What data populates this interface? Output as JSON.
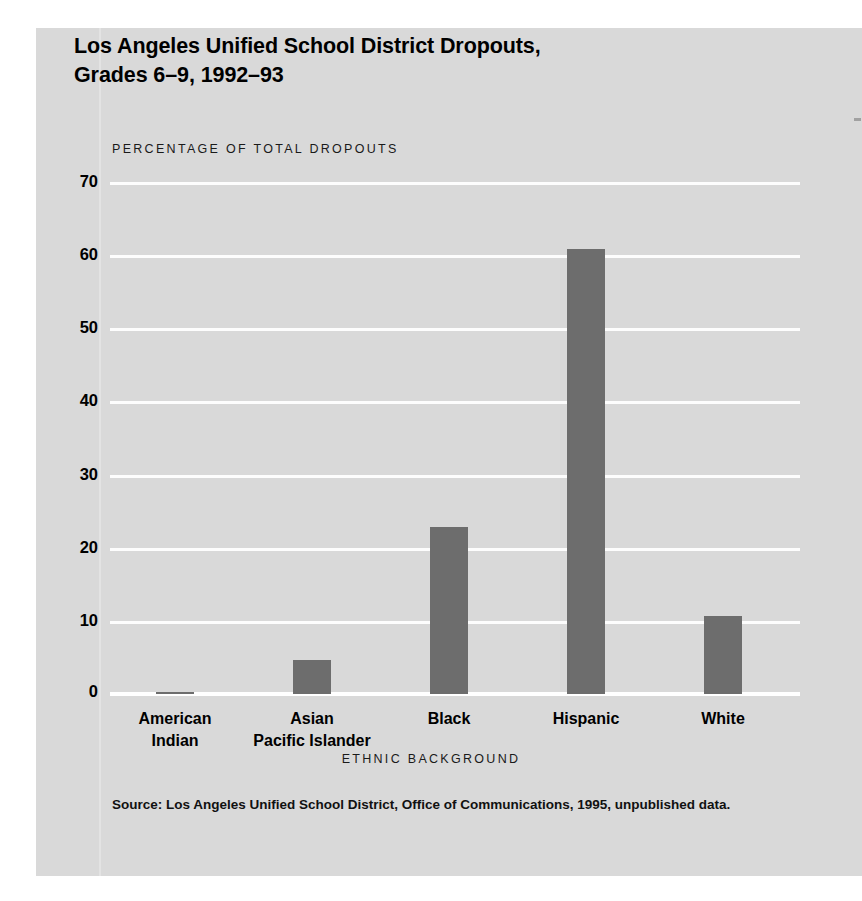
{
  "figure": {
    "title_lines": [
      "Los Angeles Unified School District Dropouts,",
      "Grades 6–9, 1992–93"
    ],
    "source_note": "Source: Los Angeles Unified School District, Office of Communications, 1995, unpublished data.",
    "panel_color": "#d9d9d9",
    "page_color": "#ffffff",
    "bar_color": "#6d6d6d",
    "gridline_color": "#fdfdfd",
    "text_color": "#000000"
  },
  "chart_data": {
    "type": "bar",
    "title": "Los Angeles Unified School District Dropouts, Grades 6–9, 1992–93",
    "subtitle": "",
    "xlabel": "ETHNIC BACKGROUND",
    "ylabel": "PERCENTAGE OF TOTAL DROPOUTS",
    "categories": [
      "American Indian",
      "Asian Pacific Islander",
      "Black",
      "Hispanic",
      "White"
    ],
    "category_label_lines": [
      [
        "American",
        "Indian"
      ],
      [
        "Asian",
        "Pacific Islander"
      ],
      [
        "Black",
        ""
      ],
      [
        "Hispanic",
        ""
      ],
      [
        "White",
        ""
      ]
    ],
    "values": [
      0.3,
      4.7,
      22.8,
      60.8,
      10.7
    ],
    "ylim": [
      0,
      70
    ],
    "ytick_labels": [
      "70",
      "60",
      "50",
      "40",
      "30",
      "20",
      "10",
      "0"
    ],
    "ytick_values": [
      70,
      60,
      50,
      40,
      30,
      20,
      10,
      0
    ],
    "grid": true,
    "grid_axis": "y",
    "legend": false,
    "legend_position": "none"
  }
}
